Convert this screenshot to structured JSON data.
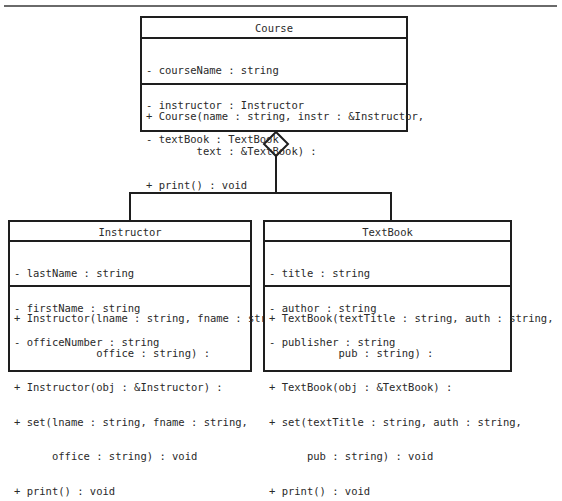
{
  "diagram": {
    "type": "UML class diagram",
    "relationship": {
      "kind": "aggregation",
      "whole": "Course",
      "parts": [
        "Instructor",
        "TextBook"
      ]
    },
    "classes": {
      "course": {
        "name": "Course",
        "attributes": [
          "- courseName : string",
          "- instructor : Instructor",
          "- textBook : TextBook"
        ],
        "operations": [
          "+ Course(name : string, instr : &Instructor,",
          "        text : &TextBook) :",
          "+ print() : void"
        ]
      },
      "instructor": {
        "name": "Instructor",
        "attributes": [
          "- lastName : string",
          "- firstName : string",
          "- officeNumber : string"
        ],
        "operations": [
          "+ Instructor(lname : string, fname : string,",
          "             office : string) :",
          "+ Instructor(obj : &Instructor) :",
          "+ set(lname : string, fname : string,",
          "      office : string) : void",
          "+ print() : void"
        ]
      },
      "textbook": {
        "name": "TextBook",
        "attributes": [
          "- title : string",
          "- author : string",
          "- publisher : string"
        ],
        "operations": [
          "+ TextBook(textTitle : string, auth : string,",
          "           pub : string) :",
          "+ TextBook(obj : &TextBook) :",
          "+ set(textTitle : string, auth : string,",
          "      pub : string) : void",
          "+ print() : void"
        ]
      }
    }
  }
}
